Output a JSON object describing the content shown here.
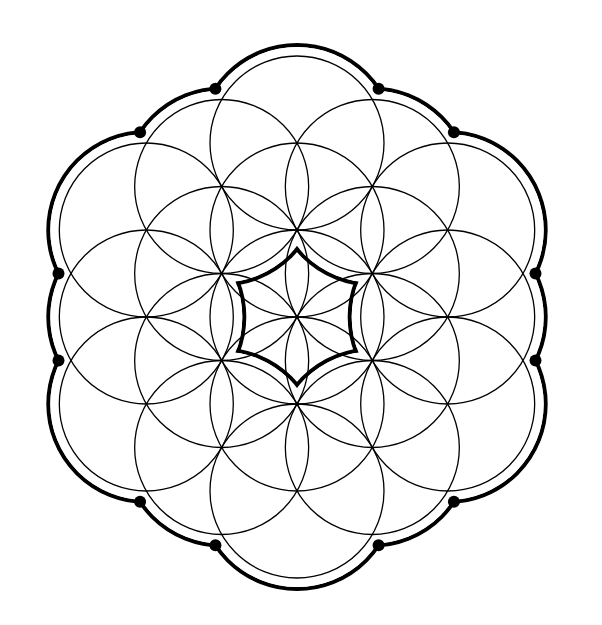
{
  "figure": {
    "background": "#ffffff",
    "line_color": "#000000",
    "center": [
      297,
      317
    ],
    "circle_radius": 87,
    "lattice_spacing": 87,
    "thin_stroke_width": 1.3,
    "outer_ring_radius": 98,
    "outer_ring_stroke_width": 4,
    "junction_dot_radius": 6,
    "circles": [
      {
        "ring": 0,
        "q": 0,
        "r": 0
      },
      {
        "ring": 1,
        "q": 0,
        "r": -1
      },
      {
        "ring": 1,
        "q": 1,
        "r": -1
      },
      {
        "ring": 1,
        "q": 1,
        "r": 0
      },
      {
        "ring": 1,
        "q": 0,
        "r": 1
      },
      {
        "ring": 1,
        "q": -1,
        "r": 1
      },
      {
        "ring": 1,
        "q": -1,
        "r": 0
      },
      {
        "ring": 2,
        "q": 0,
        "r": -2
      },
      {
        "ring": 2,
        "q": 1,
        "r": -2
      },
      {
        "ring": 2,
        "q": 2,
        "r": -2
      },
      {
        "ring": 2,
        "q": 2,
        "r": -1
      },
      {
        "ring": 2,
        "q": 2,
        "r": 0
      },
      {
        "ring": 2,
        "q": 1,
        "r": 1
      },
      {
        "ring": 2,
        "q": 0,
        "r": 2
      },
      {
        "ring": 2,
        "q": -1,
        "r": 2
      },
      {
        "ring": 2,
        "q": -2,
        "r": 2
      },
      {
        "ring": 2,
        "q": -2,
        "r": 1
      },
      {
        "ring": 2,
        "q": -2,
        "r": 0
      },
      {
        "ring": 2,
        "q": -1,
        "r": -1
      }
    ]
  }
}
